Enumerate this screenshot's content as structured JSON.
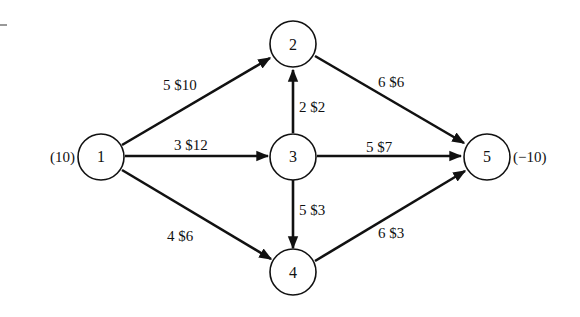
{
  "diagram": {
    "type": "network-flow",
    "nodes": [
      {
        "id": "1",
        "label": "1",
        "supply_label": "(10)"
      },
      {
        "id": "2",
        "label": "2"
      },
      {
        "id": "3",
        "label": "3"
      },
      {
        "id": "4",
        "label": "4"
      },
      {
        "id": "5",
        "label": "5",
        "supply_label": "(−10)"
      }
    ],
    "edges": [
      {
        "from": "1",
        "to": "2",
        "label": "5 $10",
        "capacity": 5,
        "cost": 10
      },
      {
        "from": "1",
        "to": "3",
        "label": "3 $12",
        "capacity": 3,
        "cost": 12
      },
      {
        "from": "1",
        "to": "4",
        "label": "4 $6",
        "capacity": 4,
        "cost": 6
      },
      {
        "from": "3",
        "to": "2",
        "label": "2 $2",
        "capacity": 2,
        "cost": 2
      },
      {
        "from": "3",
        "to": "5",
        "label": "5 $7",
        "capacity": 5,
        "cost": 7
      },
      {
        "from": "3",
        "to": "4",
        "label": "5 $3",
        "capacity": 5,
        "cost": 3
      },
      {
        "from": "2",
        "to": "5",
        "label": "6 $6",
        "capacity": 6,
        "cost": 6
      },
      {
        "from": "4",
        "to": "5",
        "label": "6 $3",
        "capacity": 6,
        "cost": 3
      }
    ]
  }
}
